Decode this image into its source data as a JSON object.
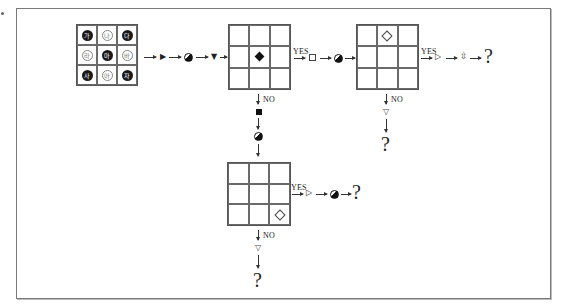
{
  "diagram": {
    "title": "",
    "grid_start": {
      "cells": [
        {
          "label": "가",
          "style": "filled"
        },
        {
          "label": "나",
          "style": "hollow"
        },
        {
          "label": "다",
          "style": "filled"
        },
        {
          "label": "라",
          "style": "hollow"
        },
        {
          "label": "마",
          "style": "filled"
        },
        {
          "label": "바",
          "style": "hollow"
        },
        {
          "label": "사",
          "style": "filled"
        },
        {
          "label": "아",
          "style": "hollow"
        },
        {
          "label": "자",
          "style": "filled"
        }
      ]
    },
    "first_sequence": [
      "triangle-right-filled",
      "half-filled-circle",
      "triangle-down-filled"
    ],
    "grid_center_mark": {
      "symbol": "◆",
      "position": "center"
    },
    "grid_top_mark": {
      "symbol": "◇",
      "position": "top-middle"
    },
    "grid_bottom_right_mark": {
      "symbol": "◇",
      "position": "bottom-right"
    },
    "branch_labels": {
      "yes": "YES",
      "no": "NO"
    },
    "branch1_yes_sequence": [
      "hollow-square",
      "half-filled-circle"
    ],
    "branch1_no_sequence": [
      "filled-square",
      "half-filled-circle"
    ],
    "branch2_yes_sequence": [
      "triangle-right-hollow",
      "up-down-arrow-hollow"
    ],
    "branch2_no_sequence": [
      "triangle-down-hollow"
    ],
    "branch3_yes_sequence": [
      "triangle-right-hollow",
      "half-filled-circle"
    ],
    "branch3_no_sequence": [
      "triangle-down-hollow"
    ],
    "glyphs": {
      "tri_right_filled": "▶",
      "tri_down_filled": "▼",
      "tri_right_hollow": "▷",
      "tri_down_hollow": "▽",
      "updown": "⇳",
      "question": "?"
    },
    "colors": {
      "frame": "#7a7a7a",
      "ink": "#1a1a1a",
      "grid_line": "#6a6a6a"
    }
  }
}
